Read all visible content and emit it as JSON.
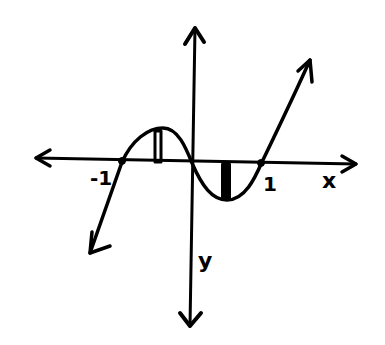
{
  "diagram": {
    "type": "hand-drawn function graph",
    "axes": {
      "x_label": "x",
      "y_label": "y",
      "tick_labels": [
        "-1",
        "1"
      ]
    },
    "curve": {
      "shape": "cubic (y = x^3 - x)",
      "roots": [
        -1,
        0,
        1
      ],
      "local_max_region": "between -1 and 0",
      "local_min_region": "between 0 and 1",
      "arrows_at_ends": true
    },
    "rectangles": [
      {
        "position": "under local maximum (between -1 and 0)",
        "style": "outlined"
      },
      {
        "position": "above local minimum (between 0 and 1)",
        "style": "filled"
      }
    ],
    "colors": {
      "ink": "#000000",
      "background": "#ffffff"
    }
  }
}
